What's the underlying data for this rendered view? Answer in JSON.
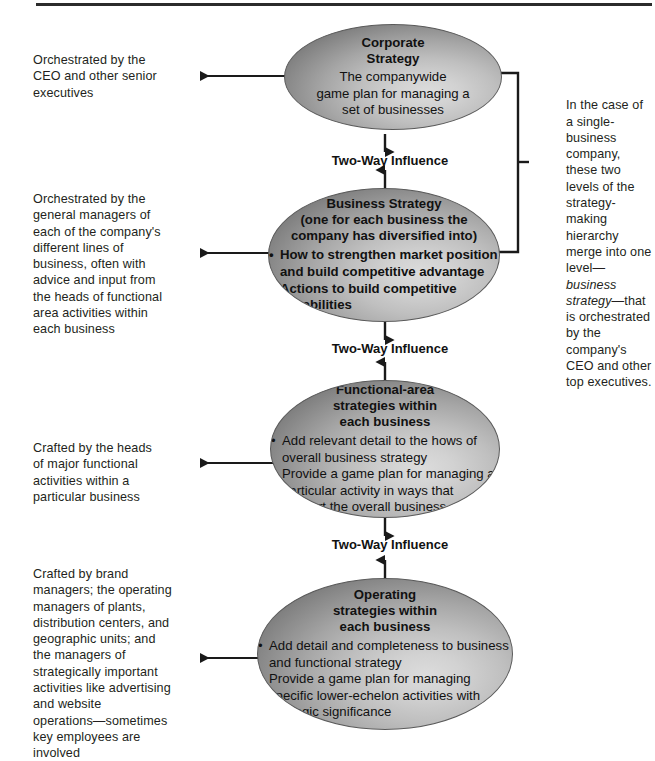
{
  "diagram": {
    "title": "Strategy-Making Hierarchy",
    "influence_label": "Two-Way Influence",
    "levels": [
      {
        "id": "corporate",
        "title": "Corporate\nStrategy",
        "body": "The companywide\ngame plan for managing a\nset of businesses",
        "bullets": [],
        "side_note": "Orchestrated by the\nCEO and other senior\nexecutives"
      },
      {
        "id": "business",
        "title": "Business Strategy",
        "subtitle": "(one for each business the\ncompany has diversified into)",
        "bullets": [
          "How to strengthen market position\nand build competitive advantage",
          "Actions to build competitive\ncapabilities"
        ],
        "side_note": "Orchestrated by the\ngeneral managers of\neach of the company's\ndifferent lines of\nbusiness, often with\nadvice and input from\nthe heads of functional\narea activities within\neach business"
      },
      {
        "id": "functional-area",
        "title": "Functional-area\nstrategies within\neach business",
        "bullets": [
          "Add relevant detail to the hows of\noverall business strategy",
          "Provide a game plan for managing\na particular activity in ways that\nsupport the overall business"
        ],
        "side_note": "Crafted by the heads\nof major functional\nactivities within a\nparticular business"
      },
      {
        "id": "operating",
        "title": "Operating\nstrategies within\neach business",
        "bullets": [
          "Add detail and completeness to business\nand functional strategy",
          "Provide a game plan for managing specific\nlower-echelon activities with strategic\nsignificance"
        ],
        "side_note": "Crafted by brand\nmanagers; the operating\nmanagers of plants,\ndistribution centers, and\ngeographic units; and\nthe managers of\nstrategically important\nactivities like advertising\nand website\noperations—sometimes\nkey employees are\ninvolved"
      }
    ],
    "bracket_note": {
      "before": "In the case of a single-business company, these two levels of the strategy-making hierarchy merge into one level—",
      "italic": "business strategy",
      "after": "—that is orchestrated by the company's CEO and other top executives."
    },
    "colors": {
      "ellipse_edge": "#787878",
      "ellipse_highlight": "#dcdcdc",
      "ellipse_stroke": "#5a5a5a",
      "text": "#231f20",
      "line": "#1a1a1a",
      "background": "#ffffff"
    }
  }
}
